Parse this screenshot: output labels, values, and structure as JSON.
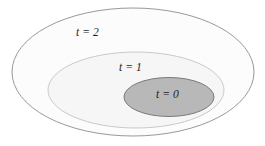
{
  "figure": {
    "background_color": "#ffffff",
    "width": 265,
    "height": 146,
    "labels": {
      "outer": "t = 2",
      "middle": "t = 1",
      "inner": "t = 0"
    }
  },
  "chart_data": {
    "type": "diagram",
    "title": "",
    "subtitle": "",
    "xlabel": "",
    "ylabel": "",
    "grid": false,
    "legend": "none",
    "shapes": [
      {
        "name": "outer-ellipse",
        "label": "t = 2",
        "level": 2,
        "cx": 133,
        "cy": 72,
        "rx": 121,
        "ry": 64,
        "fill": "#fcfcfc",
        "stroke": "#8d8d8d",
        "stroke_width": 0.9,
        "label_x": 82,
        "label_y": 33
      },
      {
        "name": "middle-ellipse",
        "label": "t = 1",
        "level": 1,
        "cx": 136,
        "cy": 90,
        "rx": 88,
        "ry": 38,
        "fill": "#f6f6f6",
        "stroke": "#bdbdbd",
        "stroke_width": 0.8,
        "label_x": 125,
        "label_y": 68
      },
      {
        "name": "inner-ellipse",
        "label": "t = 0",
        "level": 0,
        "cx": 169,
        "cy": 97,
        "rx": 45,
        "ry": 19.5,
        "fill": "#b8b8b8",
        "stroke": "#6f6f6f",
        "stroke_width": 0.9,
        "label_x": 162,
        "label_y": 95
      }
    ],
    "colors": {
      "outer_fill": "#fcfcfc",
      "middle_fill": "#f6f6f6",
      "inner_fill": "#b8b8b8",
      "outline": "#8d8d8d",
      "text": "#1c1c1c",
      "background": "#ffffff"
    }
  }
}
